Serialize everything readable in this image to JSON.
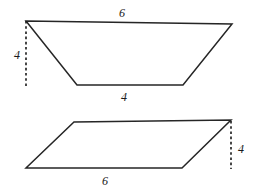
{
  "figure": {
    "background_color": "#ffffff",
    "stroke_color": "#262626",
    "label_color": "#1a1a1a",
    "width": 257,
    "height": 194,
    "shapes": [
      {
        "id": "trapezoid",
        "name": "trapezoid",
        "outline_points": "26,21 232,24 183,85 77,85",
        "height_line": {
          "x1": 26,
          "y1": 21,
          "x2": 26,
          "y2": 88
        },
        "labels": [
          {
            "id": "trapezoid-top-base",
            "text": "6",
            "x": 122,
            "y": 13
          },
          {
            "id": "trapezoid-height",
            "text": "4",
            "x": 17,
            "y": 55
          },
          {
            "id": "trapezoid-bottom-base",
            "text": "4",
            "x": 124,
            "y": 97
          }
        ]
      },
      {
        "id": "parallelogram",
        "name": "parallelogram",
        "outline_points": "74,122 231,120 182,168 26,168",
        "height_line": {
          "x1": 231,
          "y1": 121,
          "x2": 231,
          "y2": 169
        },
        "labels": [
          {
            "id": "parallelogram-height",
            "text": "4",
            "x": 241,
            "y": 149
          },
          {
            "id": "parallelogram-base",
            "text": "6",
            "x": 105,
            "y": 181
          }
        ]
      }
    ]
  }
}
